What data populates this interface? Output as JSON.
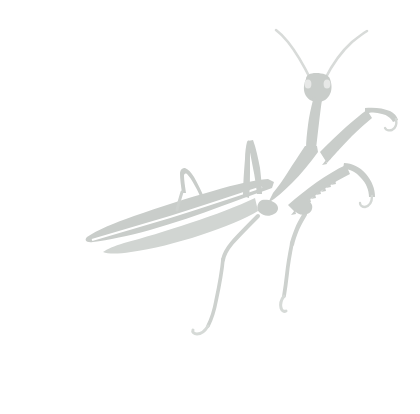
{
  "image": {
    "subject": "praying-mantis",
    "description": "Light gray silhouette of a praying mantis facing right, antennae raised in a V, raptorial forelegs held out to the right, long tapered wing sweeping to the lower left, thin hind legs descending with hooked tarsi.",
    "width": 420,
    "height": 414,
    "background_color": "#ffffff",
    "silhouette_color": "#c9cdca",
    "silhouette_color_light": "#d5d9d6",
    "silhouette_color_soft": "#dfe2e0",
    "style": "flat-monochrome-silhouette",
    "orientation": "facing-right"
  },
  "parts": [
    {
      "id": "antenna-left",
      "label": "Left Antenna"
    },
    {
      "id": "antenna-right",
      "label": "Right Antenna"
    },
    {
      "id": "head",
      "label": "Head"
    },
    {
      "id": "eye-left",
      "label": "Left Compound Eye"
    },
    {
      "id": "eye-right",
      "label": "Right Compound Eye"
    },
    {
      "id": "prothorax",
      "label": "Prothorax / Neck"
    },
    {
      "id": "thorax",
      "label": "Thorax"
    },
    {
      "id": "foreleg-upper",
      "label": "Upper Raptorial Foreleg"
    },
    {
      "id": "foreleg-lower",
      "label": "Lower Raptorial Foreleg"
    },
    {
      "id": "wing",
      "label": "Forewing"
    },
    {
      "id": "abdomen",
      "label": "Abdomen"
    },
    {
      "id": "midleg-left",
      "label": "Left Middle Leg"
    },
    {
      "id": "midleg-right",
      "label": "Right Middle Leg"
    },
    {
      "id": "hindleg-left",
      "label": "Left Hind Leg"
    },
    {
      "id": "hindleg-right",
      "label": "Right Hind Leg"
    }
  ]
}
